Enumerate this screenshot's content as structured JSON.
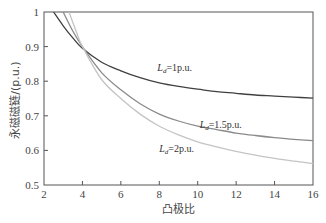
{
  "chart_data": {
    "type": "line",
    "title": "",
    "xlabel": "凸极比",
    "ylabel": "永磁磁链/(p.u.)",
    "xlim": [
      2,
      16
    ],
    "ylim": [
      0.5,
      1.0
    ],
    "xticks": [
      2,
      4,
      6,
      8,
      10,
      12,
      14,
      16
    ],
    "yticks": [
      0.5,
      0.6,
      0.7,
      0.8,
      0.9,
      1.0
    ],
    "ytick_labels": [
      "0.5",
      "0.6",
      "0.7",
      "0.8",
      "0.9",
      "1"
    ],
    "grid": false,
    "legend": "inline labels",
    "series": [
      {
        "name": "Ld=1p.u.",
        "label_main": "L",
        "label_sub": "d",
        "label_rest": "=1p.u.",
        "color": "#404040",
        "x": [
          2.5,
          3,
          3.5,
          4,
          5,
          6,
          7,
          8,
          9,
          10,
          11,
          12,
          13,
          14,
          15,
          16
        ],
        "y": [
          1.0,
          0.96,
          0.925,
          0.895,
          0.855,
          0.83,
          0.81,
          0.795,
          0.785,
          0.777,
          0.77,
          0.765,
          0.76,
          0.757,
          0.754,
          0.751
        ]
      },
      {
        "name": "Ld=1.5p.u.",
        "label_main": "L",
        "label_sub": "d",
        "label_rest": "=1.5p.u.",
        "color": "#8a8a8a",
        "x": [
          3.0,
          3.5,
          4,
          5,
          6,
          7,
          8,
          9,
          10,
          11,
          12,
          13,
          14,
          15,
          16
        ],
        "y": [
          1.0,
          0.945,
          0.9,
          0.825,
          0.775,
          0.735,
          0.705,
          0.685,
          0.67,
          0.66,
          0.65,
          0.643,
          0.637,
          0.632,
          0.628
        ]
      },
      {
        "name": "Ld=2p.u.",
        "label_main": "L",
        "label_sub": "d",
        "label_rest": "=2p.u.",
        "color": "#c4c4c4",
        "x": [
          3.3,
          3.7,
          4,
          5,
          6,
          7,
          8,
          9,
          10,
          11,
          12,
          13,
          14,
          15,
          16
        ],
        "y": [
          1.0,
          0.94,
          0.9,
          0.805,
          0.75,
          0.705,
          0.67,
          0.645,
          0.625,
          0.61,
          0.597,
          0.586,
          0.577,
          0.569,
          0.562
        ]
      }
    ],
    "annotations": [
      {
        "series": 0,
        "x": 7.9,
        "y": 0.83
      },
      {
        "series": 1,
        "x": 10.1,
        "y": 0.665
      },
      {
        "series": 2,
        "x": 8.0,
        "y": 0.595
      }
    ]
  }
}
